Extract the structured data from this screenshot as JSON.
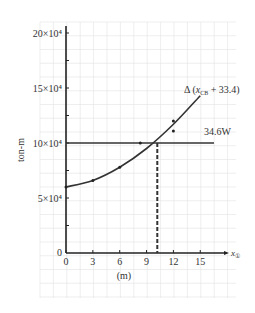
{
  "chart_data": {
    "type": "line",
    "title": "",
    "xlabel": "(m)",
    "xaxis_symbol": "x",
    "xaxis_subscript": "①",
    "ylabel": "ton-m",
    "xlim": [
      0,
      17
    ],
    "ylim": [
      0,
      200000
    ],
    "grid": true,
    "x_ticks": [
      0,
      3,
      6,
      9,
      12,
      15
    ],
    "x_tick_labels": [
      "0",
      "3",
      "6",
      "9",
      "12",
      "15"
    ],
    "y_ticks": [
      0,
      50000,
      100000,
      150000,
      200000
    ],
    "y_tick_labels": [
      "0",
      "5×10⁴",
      "10×10⁴",
      "15×10⁴",
      "20×10⁴"
    ],
    "series": [
      {
        "name": "Δ (x_CB + 33.4)",
        "label_main": "Δ (x",
        "label_sub": "CB",
        "label_tail": " + 33.4)",
        "style": "solid-curve",
        "x": [
          0,
          3,
          6,
          9,
          12,
          15
        ],
        "values": [
          60000,
          66000,
          78000,
          95000,
          117000,
          143000
        ]
      },
      {
        "name": "34.6W",
        "label": "34.6W",
        "style": "horizontal-line",
        "x": [
          0,
          17
        ],
        "values": [
          100000,
          100000
        ]
      }
    ],
    "markers": [
      {
        "x": 0,
        "y": 60000
      },
      {
        "x": 3,
        "y": 66000
      },
      {
        "x": 6,
        "y": 78000
      },
      {
        "x": 8.3,
        "y": 100000
      },
      {
        "x": 12,
        "y": 111000
      },
      {
        "x": 12,
        "y": 120000
      }
    ],
    "annotations": [
      {
        "type": "dashed-vertical",
        "x": 10.2,
        "from_y": 0,
        "to_y": 100000,
        "note": "intersection of curve and 34.6W line"
      }
    ],
    "zero_label": "0"
  }
}
